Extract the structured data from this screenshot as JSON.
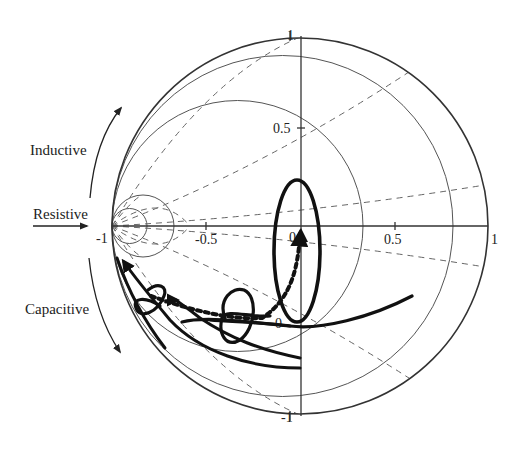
{
  "figure": {
    "type": "impedance-chart-diagram",
    "labels": {
      "inductive": "Inductive",
      "resistive": "Resistive",
      "capacitive": "Capacitive"
    },
    "axis_ticks": {
      "x_neg1": "-1",
      "x_neg05": "-0.5",
      "x_0": "0",
      "x_05": "0.5",
      "x_1": "1",
      "y_1": "1",
      "y_05": "0.5",
      "y_0": "0",
      "y_neg1": "-1"
    },
    "colors": {
      "grid": "#555555",
      "curve": "#111111",
      "background": "#ffffff"
    },
    "grid": {
      "center_px": [
        300,
        226
      ],
      "outer_radius_px": 188,
      "solid_circles_right_edges_px": [
        147,
        174,
        363,
        453,
        488
      ],
      "tangent_point_px": [
        112,
        226
      ]
    },
    "curves": [
      {
        "name": "dotted-trajectory",
        "style": "dotted-thick",
        "description": "from left loop sweeping to center arrowhead"
      },
      {
        "name": "tall-ellipse-loop",
        "style": "solid-thick"
      },
      {
        "name": "mid-small-loop",
        "style": "solid-thick"
      },
      {
        "name": "left-small-loop",
        "style": "solid-thick"
      },
      {
        "name": "right-sweep-to-left-arrow",
        "style": "solid-thick"
      },
      {
        "name": "bottom-sweep",
        "style": "solid-thick"
      }
    ]
  }
}
